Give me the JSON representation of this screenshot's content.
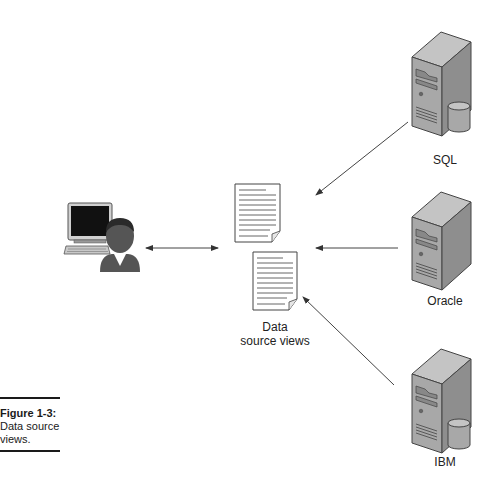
{
  "figure": {
    "number": "Figure 1-3:",
    "caption": "Data source views."
  },
  "nodes": {
    "client": {
      "label": "",
      "icon": "user-workstation-icon"
    },
    "data_source_views": {
      "label_line1": "Data",
      "label_line2": "source views",
      "icon": "document-stack-icon"
    },
    "servers": [
      {
        "label": "SQL",
        "icon": "server-with-database-icon"
      },
      {
        "label": "Oracle",
        "icon": "server-icon"
      },
      {
        "label": "IBM",
        "icon": "server-with-database-icon"
      }
    ]
  },
  "edges": [
    {
      "from": "client",
      "to": "data_source_views",
      "direction": "bidirectional"
    },
    {
      "from": "SQL",
      "to": "data_source_views",
      "direction": "one-way"
    },
    {
      "from": "Oracle",
      "to": "data_source_views",
      "direction": "one-way"
    },
    {
      "from": "IBM",
      "to": "data_source_views",
      "direction": "one-way"
    }
  ],
  "colors": {
    "server_body": "#a8a8a8",
    "server_top": "#c4c4c4",
    "server_side": "#8e8e8e",
    "user_silhouette": "#555555",
    "monitor_screen": "#111111",
    "arrow": "#444444"
  }
}
